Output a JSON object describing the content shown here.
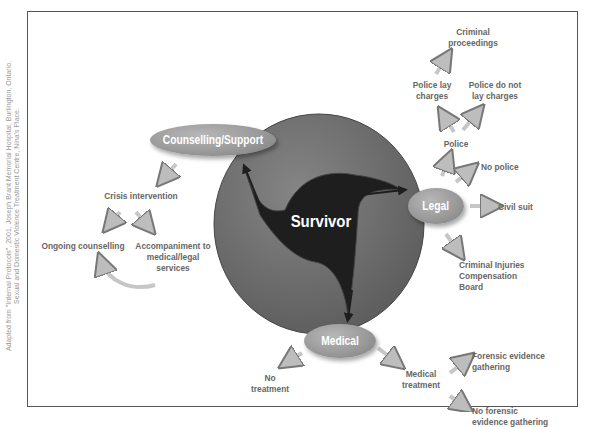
{
  "credit": {
    "line1": "Adapted from \"Internal Protocols\", 2001, Joseph Brant Memorial Hospital, Burlington, Ontario.",
    "line2": "Sexual and Domestic Violence Treatment Centre, Nina's Place."
  },
  "center": {
    "label": "Survivor"
  },
  "nodes": {
    "counselling": "Counselling/Support",
    "legal": "Legal",
    "medical": "Medical"
  },
  "counselling_branch": {
    "crisis": "Crisis intervention",
    "ongoing": "Ongoing counselling",
    "accompaniment_1": "Accompaniment to",
    "accompaniment_2": "medical/legal",
    "accompaniment_3": "services"
  },
  "legal_branch": {
    "police": "Police",
    "no_police": "No police",
    "civil_suit": "Civil suit",
    "cicb_1": "Criminal Injuries",
    "cicb_2": "Compensation",
    "cicb_3": "Board",
    "lay_1": "Police lay",
    "lay_2": "charges",
    "nolay_1": "Police do not",
    "nolay_2": "lay charges",
    "crim_1": "Criminal",
    "crim_2": "proceedings"
  },
  "medical_branch": {
    "no_treat_1": "No",
    "no_treat_2": "treatment",
    "treat_1": "Medical",
    "treat_2": "treatment",
    "forensic_1": "Forensic evidence",
    "forensic_2": "gathering",
    "noforensic_1": "No forensic",
    "noforensic_2": "evidence gathering"
  },
  "colors": {
    "circle": "#6f6f6f",
    "center_shape": "#1e1e1e",
    "node": "#9a9a9a",
    "text": "#666666",
    "arrow": "#cfcfcf"
  }
}
